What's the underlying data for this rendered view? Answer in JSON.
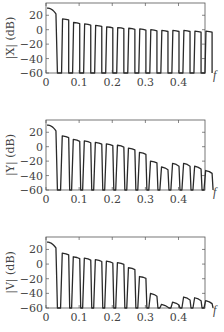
{
  "chart_data": [
    {
      "type": "line",
      "title": "",
      "xlabel": "f",
      "ylabel": "|X| (dB)",
      "xlim": [
        0,
        0.48
      ],
      "ylim": [
        -60,
        37
      ],
      "xticks": [
        0,
        0.1,
        0.2,
        0.3,
        0.4
      ],
      "xtick_labels": [
        "0",
        "0.1",
        "0.2",
        "0.3",
        "0.4"
      ],
      "yticks": [
        20,
        0,
        -20,
        -40,
        -60
      ],
      "ytick_labels": [
        "20",
        "0",
        "−20",
        "−40",
        "−60"
      ],
      "grid": false,
      "lobe_spacing": 0.0333,
      "main_lobe": {
        "start_db": 30,
        "end_db": 22
      },
      "peaks_db": [
        15,
        10,
        8,
        6,
        4,
        3,
        2,
        1,
        0,
        -1,
        -1,
        -1,
        -2,
        -2
      ]
    },
    {
      "type": "line",
      "title": "",
      "xlabel": "f",
      "ylabel": "|Y| (dB)",
      "xlim": [
        0,
        0.48
      ],
      "ylim": [
        -60,
        37
      ],
      "xticks": [
        0,
        0.1,
        0.2,
        0.3,
        0.4
      ],
      "xtick_labels": [
        "0",
        "0.1",
        "0.2",
        "0.3",
        "0.4"
      ],
      "yticks": [
        20,
        0,
        -20,
        -40,
        -60
      ],
      "ytick_labels": [
        "20",
        "0",
        "−20",
        "−40",
        "−60"
      ],
      "grid": false,
      "lobe_spacing": 0.0333,
      "main_lobe": {
        "start_db": 30,
        "end_db": 22
      },
      "peaks_db": [
        15,
        10,
        8,
        6,
        4,
        2,
        -2,
        -8,
        -20,
        -28,
        -23,
        -23,
        -27,
        -33
      ]
    },
    {
      "type": "line",
      "title": "",
      "xlabel": "f",
      "ylabel": "|V| (dB)",
      "xlim": [
        0,
        0.48
      ],
      "ylim": [
        -60,
        37
      ],
      "xticks": [
        0,
        0.1,
        0.2,
        0.3,
        0.4
      ],
      "xtick_labels": [
        "0",
        "0.1",
        "0.2",
        "0.3",
        "0.4"
      ],
      "yticks": [
        20,
        0,
        -20,
        -40,
        -60
      ],
      "ytick_labels": [
        "20",
        "0",
        "−20",
        "−40",
        "−60"
      ],
      "grid": false,
      "lobe_spacing": 0.0333,
      "main_lobe": {
        "start_db": 30,
        "end_db": 22
      },
      "peaks_db": [
        15,
        10,
        8,
        6,
        4,
        2,
        -5,
        -17,
        -40,
        -55,
        -52,
        -45,
        -46,
        -50
      ]
    }
  ],
  "panels": [
    {
      "ylabel": "|X| (dB)",
      "xlabel": "f"
    },
    {
      "ylabel": "|Y| (dB)",
      "xlabel": "f"
    },
    {
      "ylabel": "|V| (dB)",
      "xlabel": "f"
    }
  ],
  "style": {
    "line_color": "#2a2a2a",
    "frame_color": "#555555"
  }
}
